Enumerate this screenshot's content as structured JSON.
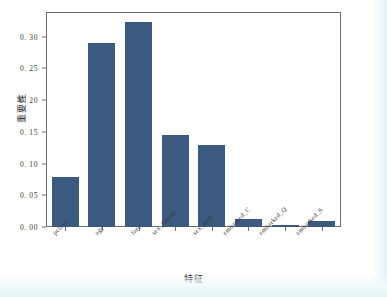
{
  "chart_data": {
    "type": "bar",
    "title": "",
    "xlabel": "特征",
    "ylabel": "重要性",
    "categories": [
      "pclass",
      "age",
      "fare",
      "sex_female",
      "sex_male",
      "embarked_C",
      "embarked_Q",
      "embarked_S"
    ],
    "values": [
      0.079,
      0.29,
      0.323,
      0.145,
      0.129,
      0.013,
      0.003,
      0.009
    ],
    "ylim": [
      0.0,
      0.3375
    ],
    "xlim_note": "categorical, 8 bars, evenly spaced",
    "ytick_labels": [
      "0. 00",
      "0. 05",
      "0. 10",
      "0. 15",
      "0. 20",
      "0. 25",
      "0. 30"
    ],
    "ytick_values": [
      0.0,
      0.05,
      0.1,
      0.15,
      0.2,
      0.25,
      0.3
    ],
    "grid": false,
    "legend": null,
    "legend_position": "none",
    "bar_color": "#3b5a80",
    "axis_color": "#6e6e6e",
    "background_color": "#ffffff",
    "xtick_label_rotation": -45
  }
}
